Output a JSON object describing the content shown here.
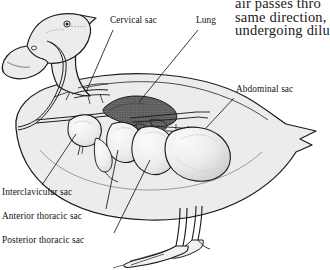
{
  "figure": {
    "colors": {
      "ink": "#1a1a1a",
      "body_fill": "#ececec",
      "sac_fill": "#f2f2f2",
      "lung_fill": "#6f6f6f",
      "page_background": "#ffffff"
    }
  },
  "labels": [
    {
      "id": "cervical-sac",
      "text": "Cervical sac"
    },
    {
      "id": "lung",
      "text": "Lung"
    },
    {
      "id": "abdominal-sac",
      "text": "Abdominal sac"
    },
    {
      "id": "interclavicular-sac",
      "text": "Interclavicular sac"
    },
    {
      "id": "anterior-thoracic-sac",
      "text": "Anterior thoracic sac"
    },
    {
      "id": "posterior-thoracic-sac",
      "text": "Posterior thoracic sac"
    }
  ],
  "excerpt": {
    "line1": "air passes thro",
    "line2": "same  direction,",
    "line3": "undergoing dilu"
  }
}
